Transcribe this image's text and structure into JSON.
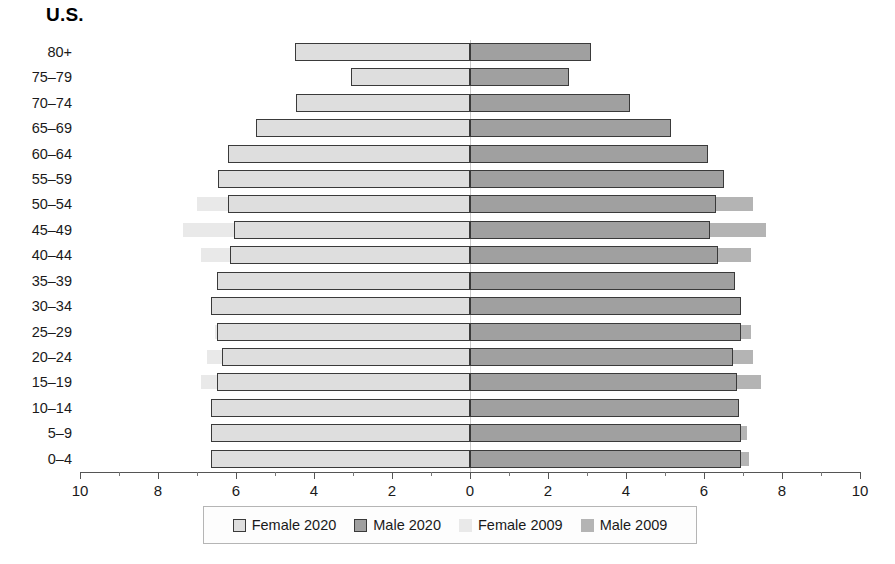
{
  "chart_data": {
    "type": "bar",
    "subtype": "population-pyramid",
    "title": "U.S.",
    "xlabel": "",
    "ylabel": "",
    "xlim": [
      -10,
      10
    ],
    "xticks": [
      10,
      8,
      6,
      4,
      2,
      0,
      2,
      4,
      6,
      8,
      10
    ],
    "xtick_labels": [
      "10",
      "8",
      "6",
      "4",
      "2",
      "0",
      "2",
      "4",
      "6",
      "8",
      "10"
    ],
    "grid": false,
    "legend_position": "bottom",
    "categories": [
      "80+",
      "75–79",
      "70–74",
      "65–69",
      "60–64",
      "55–59",
      "50–54",
      "45–49",
      "40–44",
      "35–39",
      "30–34",
      "25–29",
      "20–24",
      "15–19",
      "10–14",
      "5–9",
      "0–4"
    ],
    "series": [
      {
        "name": "Female 2020",
        "side": "left",
        "color": "#dedede",
        "border": "#3a3a3a",
        "values": [
          4.5,
          3.05,
          4.45,
          5.5,
          6.2,
          6.45,
          6.2,
          6.05,
          6.15,
          6.5,
          6.65,
          6.5,
          6.35,
          6.5,
          6.65,
          6.65,
          6.65
        ]
      },
      {
        "name": "Male 2020",
        "side": "right",
        "color": "#a0a0a0",
        "border": "#3a3a3a",
        "values": [
          3.1,
          2.55,
          4.1,
          5.15,
          6.1,
          6.5,
          6.3,
          6.15,
          6.35,
          6.8,
          6.95,
          6.95,
          6.75,
          6.85,
          6.9,
          6.95,
          6.95
        ]
      },
      {
        "name": "Female 2009",
        "side": "left",
        "color": "#e9e9e9",
        "border": "none",
        "values": [
          0,
          0,
          0,
          0,
          0,
          0,
          7.0,
          7.35,
          6.9,
          0,
          0,
          6.55,
          6.75,
          6.9,
          0,
          0,
          0
        ]
      },
      {
        "name": "Male 2009",
        "side": "right",
        "color": "#b4b4b4",
        "border": "none",
        "values": [
          0,
          0,
          0,
          0,
          0,
          0,
          7.25,
          7.6,
          7.2,
          0,
          0,
          7.2,
          7.25,
          7.45,
          0,
          7.1,
          7.15
        ]
      }
    ],
    "legend": [
      {
        "label": "Female 2020",
        "swatch": "sw-female-2020"
      },
      {
        "label": "Male 2020",
        "swatch": "sw-male-2020"
      },
      {
        "label": "Female 2009",
        "swatch": "sw-female-2009"
      },
      {
        "label": "Male 2009",
        "swatch": "sw-male-2009"
      }
    ]
  }
}
